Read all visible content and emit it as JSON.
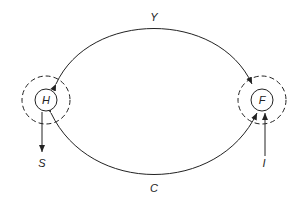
{
  "diagram": {
    "nodes": [
      {
        "id": "H",
        "label": "H",
        "cx": 46,
        "cy": 100
      },
      {
        "id": "F",
        "label": "F",
        "cx": 262,
        "cy": 100
      }
    ],
    "edges": [
      {
        "id": "Y",
        "label": "Y",
        "from": "H",
        "to": "F",
        "bidirectional": true,
        "position": "top"
      },
      {
        "id": "C",
        "label": "C",
        "from": "H",
        "to": "F",
        "bidirectional": true,
        "position": "bottom"
      },
      {
        "id": "S",
        "label": "S",
        "from": "H",
        "to": "outside",
        "direction": "out-down"
      },
      {
        "id": "I",
        "label": "I",
        "from": "outside",
        "to": "F",
        "direction": "in-up"
      }
    ],
    "colors": {
      "line": "#222222",
      "background": "#ffffff"
    }
  }
}
